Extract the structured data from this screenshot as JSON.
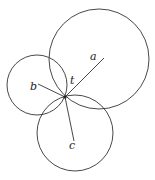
{
  "diagram": {
    "stroke_color": "#333333",
    "background": "#ffffff",
    "point": {
      "label": "t",
      "x": 65,
      "y": 97
    },
    "circles": [
      {
        "label": "a",
        "cx": 99,
        "cy": 59,
        "r": 50
      },
      {
        "label": "b",
        "cx": 37,
        "cy": 85,
        "r": 30
      },
      {
        "label": "c",
        "cx": 75,
        "cy": 133,
        "r": 38
      }
    ],
    "labels": {
      "a": "a",
      "b": "b",
      "c": "c",
      "t": "t"
    }
  }
}
